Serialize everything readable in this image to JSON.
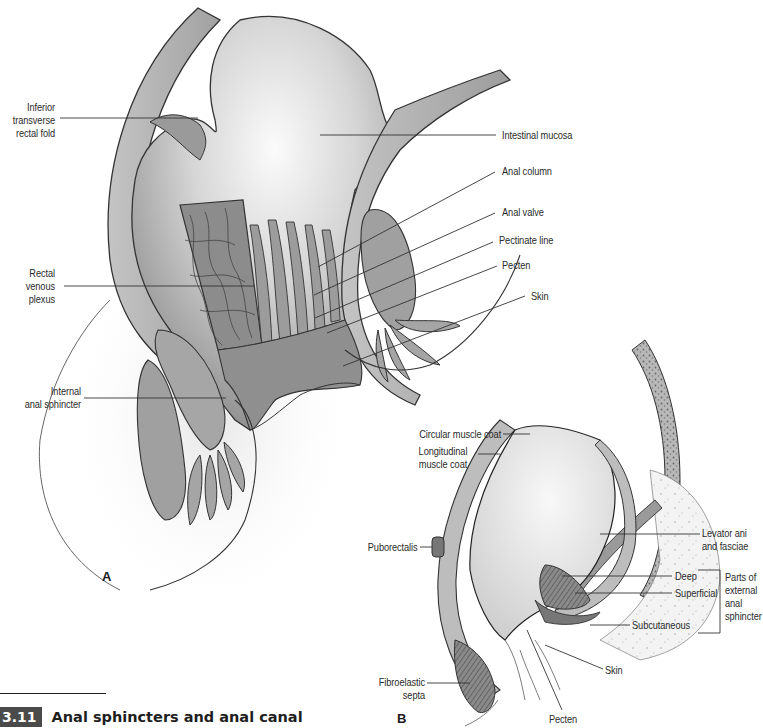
{
  "figure": {
    "number": "3.11",
    "title": "Anal sphincters and anal canal"
  },
  "panel_a": {
    "letter": "A",
    "labels": {
      "inferior_transverse_rectal_fold": [
        "Inferior",
        "transverse",
        "rectal fold"
      ],
      "intestinal_mucosa": "Intestinal mucosa",
      "anal_column": "Anal column",
      "anal_valve": "Anal valve",
      "pectinate_line": "Pectinate line",
      "pecten": "Pecten",
      "skin": "Skin",
      "rectal_venous_plexus": [
        "Rectal",
        "venous",
        "plexus"
      ],
      "internal_anal_sphincter": [
        "Internal",
        "anal sphincter"
      ]
    }
  },
  "panel_b": {
    "letter": "B",
    "labels": {
      "circular_muscle_coat": "Circular muscle coat",
      "longitudinal_muscle_coat": [
        "Longitudinal",
        "muscle coat"
      ],
      "puborectalis": "Puborectalis",
      "levator_ani": [
        "Levator ani",
        "and fasciae"
      ],
      "deep": "Deep",
      "superficial": "Superficial",
      "subcutaneous": "Subcutaneous",
      "external_sphincter_group": [
        "Parts of",
        "external",
        "anal",
        "sphincter"
      ],
      "skin": "Skin",
      "fibroelastic_septa": [
        "Fibroelastic",
        "septa"
      ],
      "pecten": "Pecten"
    },
    "artist_signature": "GM AFTER NF"
  },
  "colors": {
    "tissue_light": "#d9d9d9",
    "tissue_mid": "#a8a8a8",
    "tissue_dark": "#7a7a7a",
    "outline": "#333333",
    "badge_bg": "#4a4a4a"
  }
}
